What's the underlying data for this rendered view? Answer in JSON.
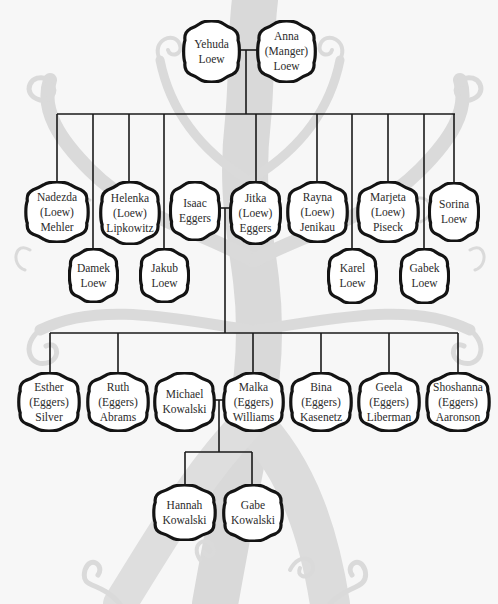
{
  "diagram": {
    "type": "family-tree",
    "colors": {
      "background": "#f7f7f7",
      "tree_silhouette": "#d6d6d6",
      "line": "#1a1a1a",
      "node_fill": "#ffffff",
      "text": "#2b2b2b"
    },
    "generation_1": {
      "yehuda": {
        "lines": [
          "Yehuda",
          "Loew"
        ]
      },
      "anna": {
        "lines": [
          "Anna",
          "(Manger)",
          "Loew"
        ]
      }
    },
    "generation_2": {
      "nadezda": {
        "lines": [
          "Nadezda",
          "(Loew)",
          "Mehler"
        ]
      },
      "damek": {
        "lines": [
          "Damek",
          "Loew"
        ]
      },
      "helenka": {
        "lines": [
          "Helenka",
          "(Loew)",
          "Lipkowitz"
        ]
      },
      "jakub": {
        "lines": [
          "Jakub",
          "Loew"
        ]
      },
      "isaac": {
        "lines": [
          "Isaac",
          "Eggers"
        ]
      },
      "jitka": {
        "lines": [
          "Jitka",
          "(Loew)",
          "Eggers"
        ]
      },
      "rayna": {
        "lines": [
          "Rayna",
          "(Loew)",
          "Jenikau"
        ]
      },
      "karel": {
        "lines": [
          "Karel",
          "Loew"
        ]
      },
      "marjeta": {
        "lines": [
          "Marjeta",
          "(Loew)",
          "Piseck"
        ]
      },
      "gabek": {
        "lines": [
          "Gabek",
          "Loew"
        ]
      },
      "sorina": {
        "lines": [
          "Sorina",
          "Loew"
        ]
      }
    },
    "generation_3": {
      "esther": {
        "lines": [
          "Esther",
          "(Eggers)",
          "Silver"
        ]
      },
      "ruth": {
        "lines": [
          "Ruth",
          "(Eggers)",
          "Abrams"
        ]
      },
      "michael": {
        "lines": [
          "Michael",
          "Kowalski"
        ]
      },
      "malka": {
        "lines": [
          "Malka",
          "(Eggers)",
          "Williams"
        ]
      },
      "bina": {
        "lines": [
          "Bina",
          "(Eggers)",
          "Kasenetz"
        ]
      },
      "geela": {
        "lines": [
          "Geela",
          "(Eggers)",
          "Liberman"
        ]
      },
      "shoshanna": {
        "lines": [
          "Shoshanna",
          "(Eggers)",
          "Aaronson"
        ]
      }
    },
    "generation_4": {
      "hannah": {
        "lines": [
          "Hannah",
          "Kowalski"
        ]
      },
      "gabe": {
        "lines": [
          "Gabe",
          "Kowalski"
        ]
      }
    }
  }
}
